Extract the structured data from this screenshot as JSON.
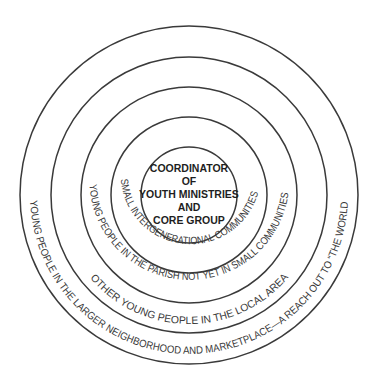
{
  "diagram": {
    "type": "concentric-circles",
    "center": {
      "lines": [
        "COORDINATOR",
        "OF",
        "YOUTH MINISTRIES",
        "AND",
        "CORE GROUP"
      ]
    },
    "rings": [
      {
        "level": 1,
        "label": "SMALL INTERGENERATIONAL COMMUNITIES"
      },
      {
        "level": 2,
        "label": "YOUNG PEOPLE IN THE PARISH NOT YET IN SMALL COMMUNITIES"
      },
      {
        "level": 3,
        "label": "OTHER YOUNG PEOPLE IN THE LOCAL AREA"
      },
      {
        "level": 4,
        "label": "YOUNG PEOPLE IN THE LARGER NEIGHBORHOOD AND MARKETPLACE—A REACH OUT TO “THE WORLD”"
      }
    ],
    "colors": {
      "stroke": "#3a3a3a",
      "text": "#3a3a3a",
      "background": "#ffffff"
    }
  }
}
